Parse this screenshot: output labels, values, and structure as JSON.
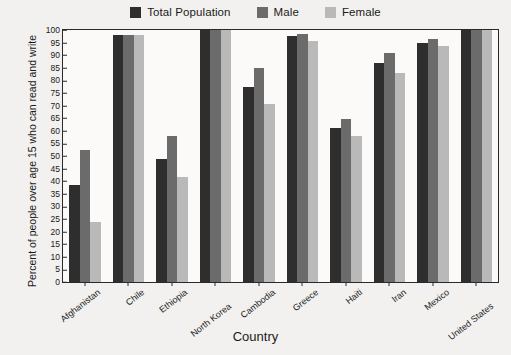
{
  "chart_data": {
    "type": "bar",
    "title": "",
    "xlabel": "Country",
    "ylabel": "Percent of people over age 15 who can read and write",
    "ylim": [
      0,
      100
    ],
    "ytick_step": 5,
    "yticks": [
      0,
      5,
      10,
      15,
      20,
      25,
      30,
      35,
      40,
      45,
      50,
      55,
      60,
      65,
      70,
      75,
      80,
      85,
      90,
      95,
      100
    ],
    "grid": false,
    "legend_position": "top-center",
    "categories": [
      "Afghanistan",
      "Chile",
      "Ethiopia",
      "North Korea",
      "Cambodia",
      "Greece",
      "Haiti",
      "Iran",
      "Mexico",
      "United States"
    ],
    "series": [
      {
        "name": "Total Population",
        "color": "#2e2e2e",
        "values": [
          38.5,
          98,
          49,
          100,
          77.5,
          97.5,
          61,
          87,
          95,
          100
        ]
      },
      {
        "name": "Male",
        "color": "#6b6b6b",
        "values": [
          52.5,
          98,
          58,
          100,
          85,
          98.5,
          64.5,
          91,
          96.5,
          100
        ]
      },
      {
        "name": "Female",
        "color": "#b9b9b9",
        "values": [
          24,
          98,
          41.5,
          100,
          70.5,
          95.5,
          58,
          83,
          93.5,
          100
        ]
      }
    ]
  },
  "colors": {
    "background": "#f2f1ef",
    "plot_background": "#fbfaf8",
    "axis": "#2a2a2a",
    "total_population": "#2e2e2e",
    "male": "#6b6b6b",
    "female": "#b9b9b9"
  }
}
